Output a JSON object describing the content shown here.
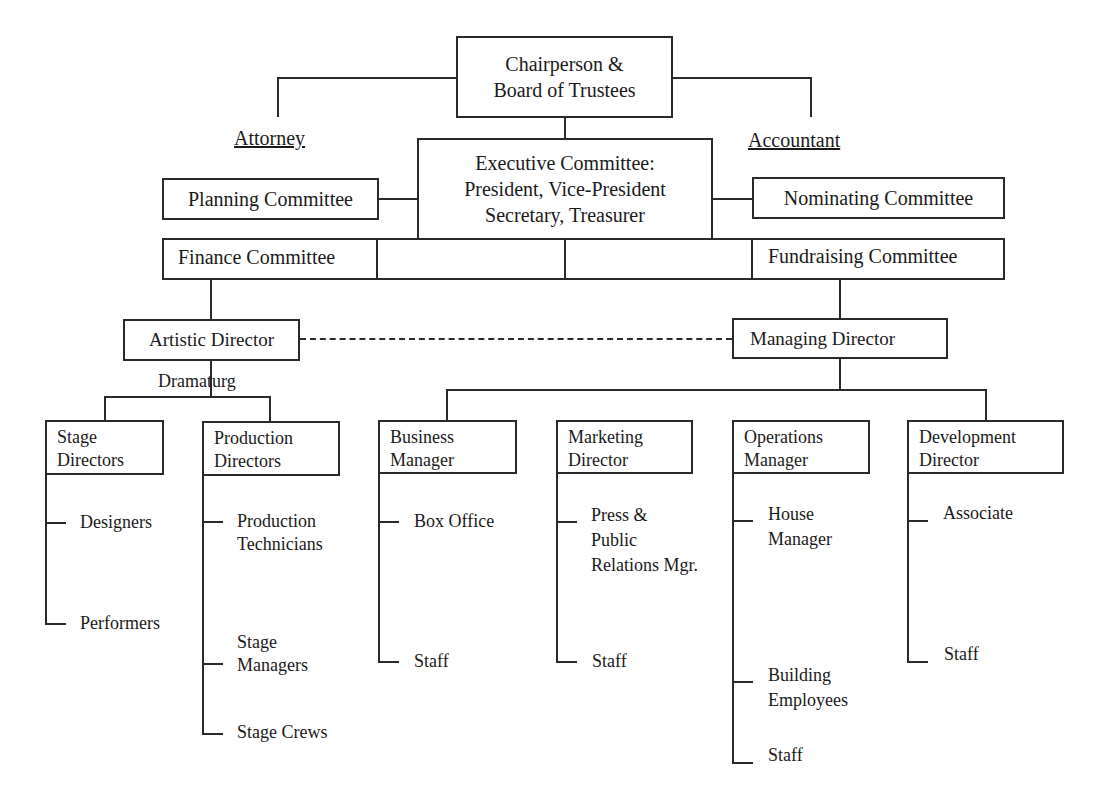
{
  "chart": {
    "top": {
      "chair": "Chairperson &\nBoard of Trustees",
      "attorney": "Attorney",
      "accountant": "Accountant",
      "executive": "Executive Committee:\nPresident, Vice-President\nSecretary, Treasurer"
    },
    "committees": {
      "planning": "Planning Committee",
      "nominating": "Nominating Committee",
      "finance": "Finance Committee",
      "fundraising": "Fundraising Committee"
    },
    "directors": {
      "artistic": "Artistic Director",
      "managing": "Managing Director",
      "dramaturg": "Dramaturg"
    },
    "departments": [
      {
        "name": "Stage\nDirectors",
        "staff": [
          "Designers",
          "Performers"
        ]
      },
      {
        "name": "Production\nDirectors",
        "staff": [
          "Production\nTechnicians",
          "Stage\nManagers",
          "Stage Crews"
        ]
      },
      {
        "name": "Business\nManager",
        "staff": [
          "Box Office",
          "Staff"
        ]
      },
      {
        "name": "Marketing\nDirector",
        "staff": [
          "Press &\nPublic\nRelations Mgr.",
          "Staff"
        ]
      },
      {
        "name": "Operations\nManager",
        "staff": [
          "House\nManager",
          "Building\nEmployees",
          "Staff"
        ]
      },
      {
        "name": "Development\nDirector",
        "staff": [
          "Associate",
          "Staff"
        ]
      }
    ]
  }
}
